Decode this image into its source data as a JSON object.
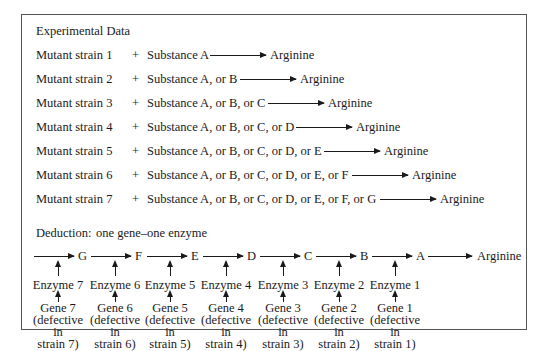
{
  "section_title": "Experimental Data",
  "product": "Arginine",
  "experiments": [
    {
      "strain": "Mutant strain 1",
      "plus": "+",
      "substances": "Substance A",
      "result": "Arginine"
    },
    {
      "strain": "Mutant strain 2",
      "plus": "+",
      "substances": "Substance A, or B",
      "result": "Arginine"
    },
    {
      "strain": "Mutant strain 3",
      "plus": "+",
      "substances": "Substance A, or B, or C",
      "result": "Arginine"
    },
    {
      "strain": "Mutant strain 4",
      "plus": "+",
      "substances": "Substance A, or B, or C, or D",
      "result": "Arginine"
    },
    {
      "strain": "Mutant strain 5",
      "plus": "+",
      "substances": "Substance A, or B, or C, or D, or E",
      "result": "Arginine"
    },
    {
      "strain": "Mutant strain 6",
      "plus": "+",
      "substances": "Substance A, or B, or C, or D, or E, or F",
      "result": "Arginine"
    },
    {
      "strain": "Mutant strain 7",
      "plus": "+",
      "substances": "Substance A, or B, or C, or D, or E, or F, or G",
      "result": "Arginine"
    }
  ],
  "deduction": {
    "label": "Deduction:",
    "text": "one gene–one enzyme"
  },
  "pathway": {
    "intermediates": [
      "G",
      "F",
      "E",
      "D",
      "C",
      "B",
      "A"
    ],
    "end_product": "Arginine",
    "steps": [
      {
        "enzyme": "Enzyme 7",
        "gene": "Gene 7",
        "defect_1": "(defective",
        "defect_2": "in",
        "defect_3": "strain 7)"
      },
      {
        "enzyme": "Enzyme 6",
        "gene": "Gene 6",
        "defect_1": "(defective",
        "defect_2": "in",
        "defect_3": "strain 6)"
      },
      {
        "enzyme": "Enzyme 5",
        "gene": "Gene 5",
        "defect_1": "(defective",
        "defect_2": "in",
        "defect_3": "strain 5)"
      },
      {
        "enzyme": "Enzyme 4",
        "gene": "Gene 4",
        "defect_1": "(defective",
        "defect_2": "in",
        "defect_3": "strain 4)"
      },
      {
        "enzyme": "Enzyme 3",
        "gene": "Gene 3",
        "defect_1": "(defective",
        "defect_2": "in",
        "defect_3": "strain 3)"
      },
      {
        "enzyme": "Enzyme 2",
        "gene": "Gene 2",
        "defect_1": "(defective",
        "defect_2": "in",
        "defect_3": "strain 2)"
      },
      {
        "enzyme": "Enzyme 1",
        "gene": "Gene 1",
        "defect_1": "(defective",
        "defect_2": "in",
        "defect_3": "strain 1)"
      }
    ]
  }
}
